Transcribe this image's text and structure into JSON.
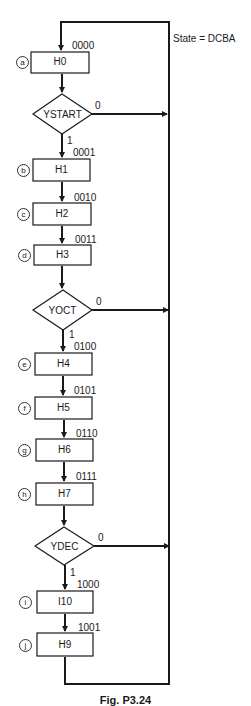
{
  "diagram": {
    "type": "flowchart",
    "state_legend": "State = DCBA",
    "caption": "Fig. P3.24",
    "line_color": "#1a1a1a",
    "states": [
      {
        "id": "a",
        "label": "H0",
        "code": "0000"
      },
      {
        "id": "b",
        "label": "H1",
        "code": "0001"
      },
      {
        "id": "c",
        "label": "H2",
        "code": "0010"
      },
      {
        "id": "d",
        "label": "H3",
        "code": "0011"
      },
      {
        "id": "e",
        "label": "H4",
        "code": "0100"
      },
      {
        "id": "f",
        "label": "H5",
        "code": "0101"
      },
      {
        "id": "g",
        "label": "H6",
        "code": "0110"
      },
      {
        "id": "h",
        "label": "H7",
        "code": "0111"
      },
      {
        "id": "i",
        "label": "I10",
        "code": "1000"
      },
      {
        "id": "j",
        "label": "H9",
        "code": "1001"
      }
    ],
    "decisions": [
      {
        "label": "YSTART",
        "false_label": "0",
        "true_label": "1"
      },
      {
        "label": "YOCT",
        "false_label": "0",
        "true_label": "1"
      },
      {
        "label": "YDEC",
        "false_label": "0",
        "true_label": "1"
      }
    ]
  }
}
